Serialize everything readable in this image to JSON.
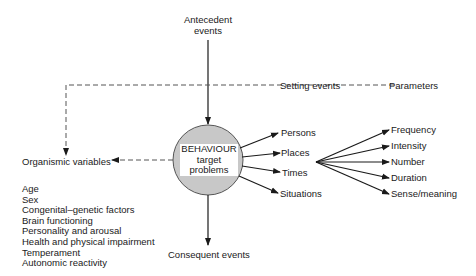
{
  "diagram": {
    "core": {
      "line1": "BEHAVIOUR",
      "line2": "target",
      "line3": "problems"
    },
    "antecedent": {
      "line1": "Antecedent",
      "line2": "events"
    },
    "setting_events": "Setting events",
    "parameters_heading": "Parameters",
    "consequent_events": "Consequent events",
    "organismic_variables": "Organismic variables",
    "organismic_list": [
      "Age",
      "Sex",
      "Congenital–genetic factors",
      "Brain functioning",
      "Personality and arousal",
      "Health and physical impairment",
      "Temperament",
      "Autonomic reactivity"
    ],
    "contexts": [
      "Persons",
      "Places",
      "Times",
      "Situations"
    ],
    "parameters": [
      "Frequency",
      "Intensity",
      "Number",
      "Duration",
      "Sense/meaning"
    ],
    "colors": {
      "circle_fill": "#c8c8c8",
      "line": "#1a1a1a",
      "dashed": "#555555"
    }
  }
}
